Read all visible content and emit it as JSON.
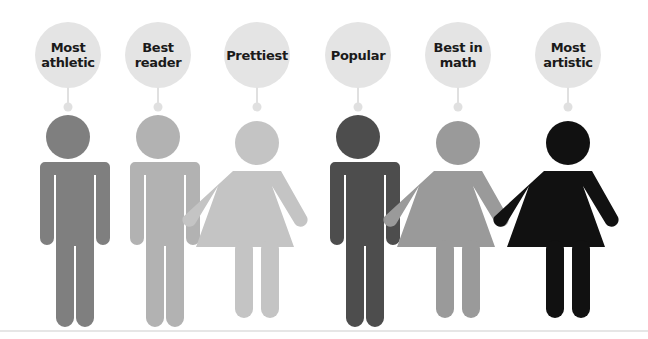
{
  "diagram": {
    "type": "labeled-figures",
    "figures": [
      {
        "label": "Most\nathletic",
        "gender": "male",
        "color": "#7f7f7f"
      },
      {
        "label": "Best\nreader",
        "gender": "male",
        "color": "#b2b2b2"
      },
      {
        "label": "Prettiest",
        "gender": "female",
        "color": "#c4c4c4"
      },
      {
        "label": "Popular",
        "gender": "male",
        "color": "#4d4d4d"
      },
      {
        "label": "Best in\nmath",
        "gender": "female",
        "color": "#9a9a9a"
      },
      {
        "label": "Most\nartistic",
        "gender": "female",
        "color": "#111111"
      }
    ],
    "bubble_color": "#e4e4e4",
    "connector_color": "#e0e0e0"
  }
}
